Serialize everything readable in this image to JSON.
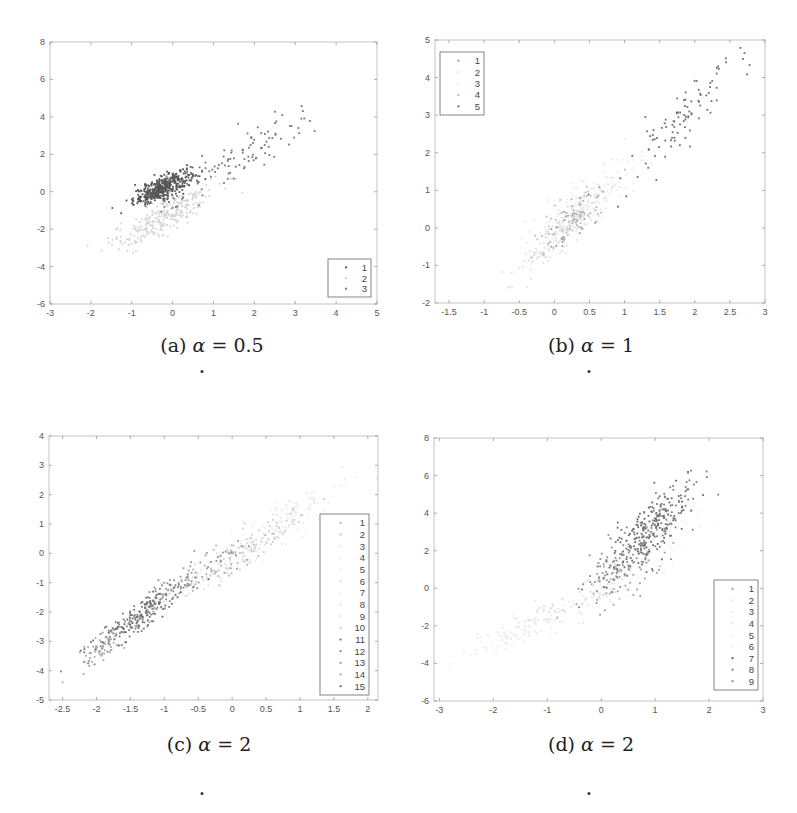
{
  "figure": {
    "panels": [
      {
        "id": "a",
        "caption_prefix": "(a) ",
        "caption_greek": "α",
        "caption_suffix": " = 0.5",
        "caption_dot": ".",
        "box": {
          "left": 50,
          "top": 42,
          "right": 377,
          "bottom": 304
        },
        "caption_pos": {
          "x": 212,
          "y": 334
        },
        "dot_pos": {
          "x": 202,
          "y": 370
        },
        "legend": {
          "left": 328,
          "top": 259,
          "right": 371,
          "bottom": 297,
          "position": "southeast"
        }
      },
      {
        "id": "b",
        "caption_prefix": "(b) ",
        "caption_greek": "α",
        "caption_suffix": " = 1",
        "caption_dot": ".",
        "box": {
          "left": 435,
          "top": 40,
          "right": 765,
          "bottom": 303
        },
        "caption_pos": {
          "x": 591,
          "y": 334
        },
        "dot_pos": {
          "x": 589,
          "y": 370
        },
        "legend": {
          "left": 440,
          "top": 52,
          "right": 484,
          "bottom": 115,
          "position": "northwest"
        }
      },
      {
        "id": "c",
        "caption_prefix": "(c) ",
        "caption_greek": "α",
        "caption_suffix": " = 2",
        "caption_dot": ".",
        "box": {
          "left": 49,
          "top": 436,
          "right": 378,
          "bottom": 700
        },
        "caption_pos": {
          "x": 209,
          "y": 733
        },
        "dot_pos": {
          "x": 202,
          "y": 792
        },
        "legend": {
          "left": 320,
          "top": 514,
          "right": 369,
          "bottom": 695,
          "position": "east"
        }
      },
      {
        "id": "d",
        "caption_prefix": "(d) ",
        "caption_greek": "α",
        "caption_suffix": " = 2",
        "caption_dot": ".",
        "box": {
          "left": 434,
          "top": 438,
          "right": 763,
          "bottom": 701
        },
        "caption_pos": {
          "x": 591,
          "y": 733
        },
        "dot_pos": {
          "x": 589,
          "y": 792
        },
        "legend": {
          "left": 714,
          "top": 580,
          "right": 758,
          "bottom": 690,
          "position": "southeast"
        }
      }
    ]
  },
  "chart_data": [
    {
      "type": "scatter",
      "title": "(a) α = 0.5",
      "xlabel": "",
      "ylabel": "",
      "xlim": [
        -3,
        5
      ],
      "ylim": [
        -6,
        8
      ],
      "xticks": [
        -3,
        -2,
        -1,
        0,
        1,
        2,
        3,
        4,
        5
      ],
      "yticks": [
        -6,
        -4,
        -2,
        0,
        2,
        4,
        6,
        8
      ],
      "grid": false,
      "legend": {
        "position": "southeast",
        "entries": [
          "1",
          "2",
          "3"
        ]
      },
      "series": [
        {
          "name": "1",
          "color": "#555555",
          "n": 420,
          "mean": [
            -0.25,
            0.2
          ],
          "sd": [
            0.35,
            0.45
          ],
          "rho": 0.75
        },
        {
          "name": "2",
          "color": "#d4d4d4",
          "n": 260,
          "mean": [
            -0.2,
            -1.3
          ],
          "sd": [
            0.65,
            0.9
          ],
          "rho": 0.85
        },
        {
          "name": "3",
          "color": "#777777",
          "n": 110,
          "mean": [
            1.6,
            1.7
          ],
          "sd": [
            1.0,
            1.4
          ],
          "rho": 0.9
        }
      ]
    },
    {
      "type": "scatter",
      "title": "(b) α = 1",
      "xlabel": "",
      "ylabel": "",
      "xlim": [
        -1.7,
        3
      ],
      "ylim": [
        -2,
        5
      ],
      "xticks": [
        -1.5,
        -1,
        -0.5,
        0,
        0.5,
        1,
        1.5,
        2,
        2.5,
        3
      ],
      "yticks": [
        -2,
        -1,
        0,
        1,
        2,
        3,
        4,
        5
      ],
      "grid": false,
      "legend": {
        "position": "northwest",
        "entries": [
          "1",
          "2",
          "3",
          "4",
          "5"
        ]
      },
      "series": [
        {
          "name": "1",
          "color": "#9a9a9a",
          "n": 60,
          "mean": [
            0.2,
            0.1
          ],
          "sd": [
            0.2,
            0.4
          ],
          "rho": 0.8
        },
        {
          "name": "2",
          "color": "#e2e2e2",
          "n": 180,
          "mean": [
            0.1,
            -0.1
          ],
          "sd": [
            0.3,
            0.55
          ],
          "rho": 0.85
        },
        {
          "name": "3",
          "color": "#ebebeb",
          "n": 140,
          "mean": [
            0.5,
            0.8
          ],
          "sd": [
            0.4,
            0.6
          ],
          "rho": 0.85
        },
        {
          "name": "4",
          "color": "#bdbdbd",
          "n": 60,
          "mean": [
            0.3,
            0.4
          ],
          "sd": [
            0.3,
            0.5
          ],
          "rho": 0.8
        },
        {
          "name": "5",
          "color": "#6f6f6f",
          "n": 95,
          "mean": [
            1.75,
            2.75
          ],
          "sd": [
            0.45,
            0.9
          ],
          "rho": 0.92
        }
      ]
    },
    {
      "type": "scatter",
      "title": "(c) α = 2",
      "xlabel": "",
      "ylabel": "",
      "xlim": [
        -2.7,
        2.15
      ],
      "ylim": [
        -5,
        4
      ],
      "xticks": [
        -2.5,
        -2,
        -1.5,
        -1,
        -0.5,
        0,
        0.5,
        1,
        1.5,
        2
      ],
      "yticks": [
        -5,
        -4,
        -3,
        -2,
        -1,
        0,
        1,
        2,
        3,
        4
      ],
      "grid": false,
      "legend": {
        "position": "east",
        "entries": [
          "1",
          "2",
          "3",
          "4",
          "5",
          "6",
          "7",
          "8",
          "9",
          "10",
          "11",
          "12",
          "13",
          "14",
          "15"
        ]
      },
      "series": [
        {
          "name": "1",
          "color": "#b5b5b5",
          "n": 40,
          "mean": [
            0.0,
            -0.2
          ],
          "sd": [
            0.35,
            0.5
          ],
          "rho": 0.8
        },
        {
          "name": "2",
          "color": "#c8c8c8",
          "n": 40,
          "mean": [
            0.6,
            0.7
          ],
          "sd": [
            0.3,
            0.45
          ],
          "rho": 0.8
        },
        {
          "name": "3",
          "color": "#e8e8e8",
          "n": 40,
          "mean": [
            1.1,
            1.6
          ],
          "sd": [
            0.35,
            0.5
          ],
          "rho": 0.8
        },
        {
          "name": "4",
          "color": "#eeeeee",
          "n": 30,
          "mean": [
            0.9,
            1.4
          ],
          "sd": [
            0.4,
            0.5
          ],
          "rho": 0.8
        },
        {
          "name": "5",
          "color": "#f0f0f0",
          "n": 20,
          "mean": [
            0.4,
            0.3
          ],
          "sd": [
            0.4,
            0.5
          ],
          "rho": 0.8
        },
        {
          "name": "6",
          "color": "#e4e4e4",
          "n": 25,
          "mean": [
            -0.3,
            -0.7
          ],
          "sd": [
            0.35,
            0.45
          ],
          "rho": 0.8
        },
        {
          "name": "7",
          "color": "#ececec",
          "n": 20,
          "mean": [
            0.7,
            1.0
          ],
          "sd": [
            0.3,
            0.4
          ],
          "rho": 0.8
        },
        {
          "name": "8",
          "color": "#dcdcdc",
          "n": 25,
          "mean": [
            -0.6,
            -1.1
          ],
          "sd": [
            0.3,
            0.4
          ],
          "rho": 0.8
        },
        {
          "name": "9",
          "color": "#e0e0e0",
          "n": 25,
          "mean": [
            0.2,
            0.1
          ],
          "sd": [
            0.3,
            0.4
          ],
          "rho": 0.8
        },
        {
          "name": "10",
          "color": "#cfcfcf",
          "n": 30,
          "mean": [
            0.1,
            0.0
          ],
          "sd": [
            0.35,
            0.5
          ],
          "rho": 0.8
        },
        {
          "name": "11",
          "color": "#7a7a7a",
          "n": 90,
          "mean": [
            -1.5,
            -2.4
          ],
          "sd": [
            0.3,
            0.5
          ],
          "rho": 0.85
        },
        {
          "name": "12",
          "color": "#8a8a8a",
          "n": 70,
          "mean": [
            -1.05,
            -1.6
          ],
          "sd": [
            0.25,
            0.45
          ],
          "rho": 0.85
        },
        {
          "name": "13",
          "color": "#9a9a9a",
          "n": 50,
          "mean": [
            -0.4,
            -0.6
          ],
          "sd": [
            0.3,
            0.5
          ],
          "rho": 0.8
        },
        {
          "name": "14",
          "color": "#a8a8a8",
          "n": 70,
          "mean": [
            -1.9,
            -3.2
          ],
          "sd": [
            0.25,
            0.45
          ],
          "rho": 0.85
        },
        {
          "name": "15",
          "color": "#6e6e6e",
          "n": 80,
          "mean": [
            -1.35,
            -2.1
          ],
          "sd": [
            0.3,
            0.5
          ],
          "rho": 0.85
        }
      ]
    },
    {
      "type": "scatter",
      "title": "(d) α = 2",
      "xlabel": "",
      "ylabel": "",
      "xlim": [
        -3.1,
        3
      ],
      "ylim": [
        -6,
        8
      ],
      "xticks": [
        -3,
        -2,
        -1,
        0,
        1,
        2,
        3
      ],
      "yticks": [
        -6,
        -4,
        -2,
        0,
        2,
        4,
        6,
        8
      ],
      "grid": false,
      "legend": {
        "position": "southeast",
        "entries": [
          "1",
          "2",
          "3",
          "4",
          "5",
          "6",
          "7",
          "8",
          "9"
        ]
      },
      "series": [
        {
          "name": "1",
          "color": "#a0a0a0",
          "n": 50,
          "mean": [
            0.4,
            0.5
          ],
          "sd": [
            0.4,
            0.9
          ],
          "rho": 0.7
        },
        {
          "name": "2",
          "color": "#e6e6e6",
          "n": 70,
          "mean": [
            -0.9,
            -1.4
          ],
          "sd": [
            0.6,
            0.8
          ],
          "rho": 0.85
        },
        {
          "name": "3",
          "color": "#ededed",
          "n": 60,
          "mean": [
            -1.7,
            -2.6
          ],
          "sd": [
            0.5,
            0.6
          ],
          "rho": 0.8
        },
        {
          "name": "4",
          "color": "#dedede",
          "n": 50,
          "mean": [
            -0.2,
            -0.3
          ],
          "sd": [
            0.5,
            0.7
          ],
          "rho": 0.8
        },
        {
          "name": "5",
          "color": "#f2f2f2",
          "n": 30,
          "mean": [
            0.8,
            1.8
          ],
          "sd": [
            0.5,
            1.0
          ],
          "rho": 0.7
        },
        {
          "name": "6",
          "color": "#f0f0f0",
          "n": 30,
          "mean": [
            1.2,
            3.0
          ],
          "sd": [
            0.5,
            1.0
          ],
          "rho": 0.7
        },
        {
          "name": "7",
          "color": "#6a6a6a",
          "n": 160,
          "mean": [
            0.75,
            2.7
          ],
          "sd": [
            0.4,
            1.2
          ],
          "rho": 0.75
        },
        {
          "name": "8",
          "color": "#7e7e7e",
          "n": 110,
          "mean": [
            1.2,
            3.9
          ],
          "sd": [
            0.35,
            1.1
          ],
          "rho": 0.7
        },
        {
          "name": "9",
          "color": "#8e8e8e",
          "n": 90,
          "mean": [
            0.3,
            1.2
          ],
          "sd": [
            0.4,
            1.0
          ],
          "rho": 0.75
        }
      ]
    }
  ]
}
